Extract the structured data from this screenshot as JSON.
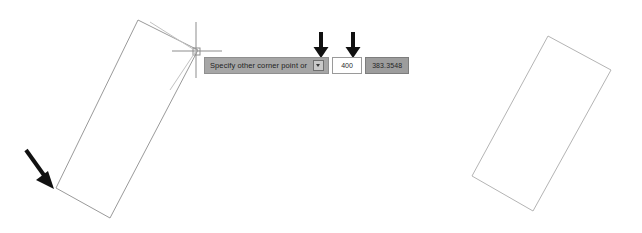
{
  "app": {
    "background_color": "#ffffff",
    "line_color": "#9a9a9a",
    "annotation_color": "#111111"
  },
  "dynamic_input": {
    "prompt_text": "Specify other corner point or",
    "dropdown_icon": "chevron-down-icon",
    "prompt_bg_color": "#a6a6a6",
    "fields": [
      {
        "name": "x-distance",
        "value": "400",
        "state": "editing",
        "bg_color": "#ffffff"
      },
      {
        "name": "y-distance",
        "value": "383.3548",
        "state": "highlighted",
        "bg_color": "#9d9d9d"
      }
    ]
  },
  "cursor": {
    "type": "crosshair-cursor",
    "x": 196,
    "y": 51
  },
  "annotations": {
    "arrow_down_first": {
      "name": "arrow-pointing-to-x-field",
      "x": 321,
      "y_top": 32,
      "y_bottom": 58
    },
    "arrow_down_second": {
      "name": "arrow-pointing-to-y-field",
      "x": 353,
      "y_top": 32,
      "y_bottom": 58
    },
    "arrow_diagonal": {
      "name": "arrow-pointing-to-first-corner",
      "x_start": 26,
      "y_start": 150,
      "x_end": 52,
      "y_end": 186
    }
  },
  "shapes": [
    {
      "name": "rectangle-being-drawn",
      "points": "138,20 198,50 110,218 56,188"
    },
    {
      "name": "rectangle-result",
      "points": "548,36 611,70 533,211 472,176"
    }
  ]
}
